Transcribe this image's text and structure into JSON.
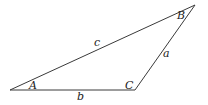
{
  "diagram": {
    "type": "triangle",
    "vertices": [
      {
        "id": "A",
        "label": "A",
        "x": 10,
        "y": 90,
        "label_x": 29,
        "label_y": 89
      },
      {
        "id": "B",
        "label": "B",
        "x": 195,
        "y": 5,
        "label_x": 177,
        "label_y": 19
      },
      {
        "id": "C",
        "label": "C",
        "x": 135,
        "y": 90,
        "label_x": 125,
        "label_y": 89
      }
    ],
    "sides": [
      {
        "id": "a",
        "label": "a",
        "from": "C",
        "to": "B",
        "label_x": 163,
        "label_y": 57
      },
      {
        "id": "b",
        "label": "b",
        "from": "A",
        "to": "C",
        "label_x": 77,
        "label_y": 100
      },
      {
        "id": "c",
        "label": "c",
        "from": "A",
        "to": "B",
        "label_x": 94,
        "label_y": 46
      }
    ],
    "colors": {
      "stroke": "#3a3a3a",
      "text": "#222222"
    }
  }
}
